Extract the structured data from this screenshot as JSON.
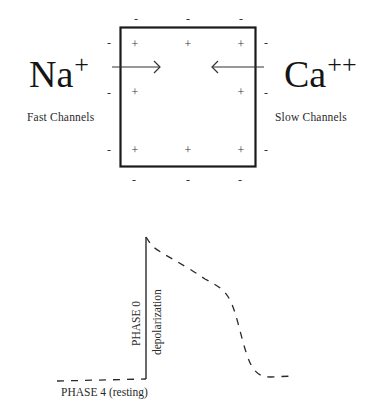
{
  "membrane_diagram": {
    "left_ion": {
      "label": "Na",
      "charge": "+"
    },
    "right_ion": {
      "label": "Ca",
      "charge": "++"
    },
    "left_channel_label": "Fast Channels",
    "right_channel_label": "Slow Channels",
    "inside_charge": "+",
    "outside_charge": "-",
    "arrow_left_direction": "inward",
    "arrow_right_direction": "inward"
  },
  "action_potential": {
    "phase0_label": "PHASE 0",
    "phase0_sublabel": "depolarization",
    "phase4_label": "PHASE 4 (resting)"
  },
  "colors": {
    "ink": "#1a1a1a",
    "background": "#ffffff"
  }
}
